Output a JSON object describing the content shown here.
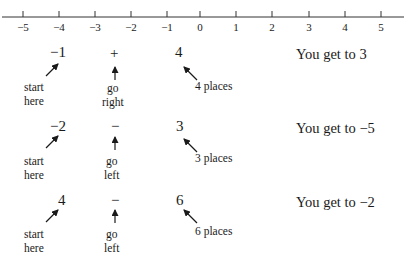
{
  "number_line": {
    "ticks": [
      "−5",
      "−4",
      "−3",
      "−2",
      "−1",
      "0",
      "1",
      "2",
      "3",
      "4",
      "5"
    ]
  },
  "examples": [
    {
      "start": "−1",
      "operator": "+",
      "amount": "4",
      "start_label_1": "start",
      "start_label_2": "here",
      "op_label_1": "go",
      "op_label_2": "right",
      "places_label": "4 places",
      "result": "You get to 3"
    },
    {
      "start": "−2",
      "operator": "−",
      "amount": "3",
      "start_label_1": "start",
      "start_label_2": "here",
      "op_label_1": "go",
      "op_label_2": "left",
      "places_label": "3 places",
      "result": "You get to −5"
    },
    {
      "start": "4",
      "operator": "−",
      "amount": "6",
      "start_label_1": "start",
      "start_label_2": "here",
      "op_label_1": "go",
      "op_label_2": "left",
      "places_label": "6 places",
      "result": "You get to −2"
    }
  ]
}
